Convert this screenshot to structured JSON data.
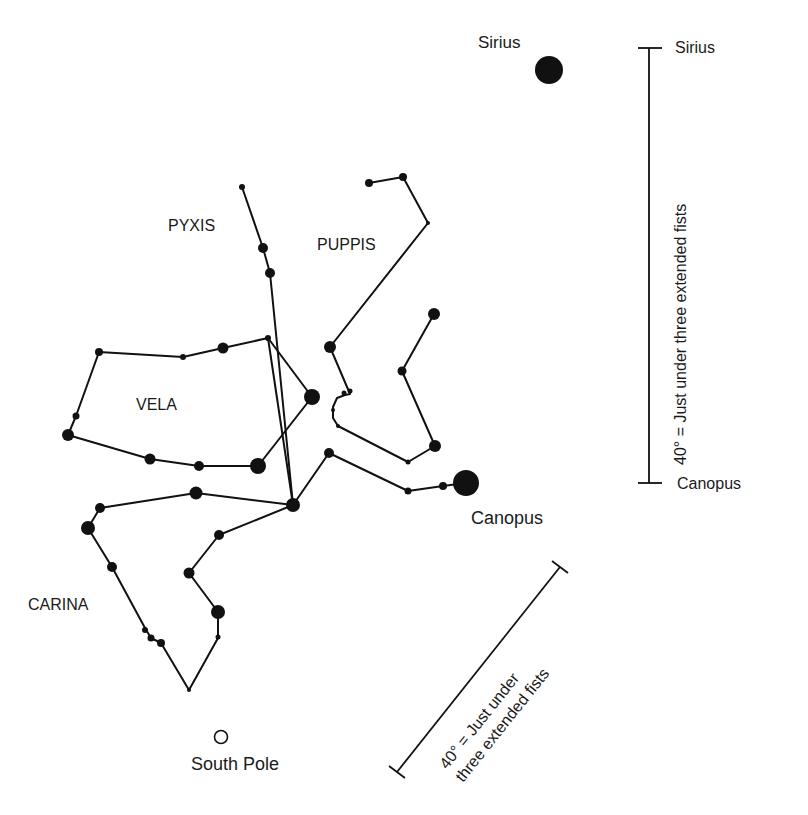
{
  "colors": {
    "ink": "#111111",
    "background": "#ffffff"
  },
  "labels": {
    "sirius_star": "Sirius",
    "canopus_star": "Canopus",
    "south_pole": "South Pole",
    "pyxis": "PYXIS",
    "puppis": "PUPPIS",
    "vela": "VELA",
    "carina": "CARINA"
  },
  "scale_vertical": {
    "top_label": "Sirius",
    "bottom_label": "Canopus",
    "text": "40° = Just under three extended fists"
  },
  "scale_diagonal": {
    "line1": "40° = Just under",
    "line2": "three extended fists"
  },
  "chart_data": {
    "type": "star-chart",
    "stars": {
      "sirius": {
        "x": 549,
        "y": 70,
        "r": 14
      },
      "canopus": {
        "x": 466,
        "y": 483,
        "r": 13
      },
      "hub": {
        "x": 293,
        "y": 505,
        "r": 7
      }
    },
    "lines": [
      {
        "name": "pyxis",
        "points": [
          [
            242,
            187
          ],
          [
            263,
            248
          ],
          [
            270,
            273
          ],
          [
            293,
            505
          ]
        ]
      },
      {
        "name": "puppis-north",
        "points": [
          [
            369,
            183
          ],
          [
            403,
            177
          ],
          [
            428,
            223
          ],
          [
            330,
            347
          ],
          [
            350,
            394
          ],
          [
            345,
            395
          ],
          [
            337,
            398
          ],
          [
            333,
            407
          ],
          [
            333,
            418
          ],
          [
            338,
            426
          ],
          [
            408,
            462
          ],
          [
            435,
            446
          ],
          [
            402,
            371
          ],
          [
            434,
            314
          ]
        ]
      },
      {
        "name": "vela",
        "points": [
          [
            99,
            352
          ],
          [
            183,
            357
          ],
          [
            223,
            348
          ],
          [
            268,
            338
          ],
          [
            312,
            397
          ],
          [
            258,
            466
          ],
          [
            199,
            466
          ],
          [
            150,
            459
          ],
          [
            68,
            435
          ],
          [
            76,
            416
          ],
          [
            99,
            352
          ]
        ]
      },
      {
        "name": "vela-cross",
        "points": [
          [
            268,
            338
          ],
          [
            293,
            505
          ]
        ]
      },
      {
        "name": "puppis-south",
        "points": [
          [
            293,
            505
          ],
          [
            329,
            453
          ],
          [
            408,
            491
          ],
          [
            443,
            486
          ],
          [
            466,
            483
          ]
        ]
      },
      {
        "name": "hub-west",
        "points": [
          [
            293,
            505
          ],
          [
            196,
            493
          ],
          [
            100,
            508
          ],
          [
            88,
            528
          ]
        ]
      },
      {
        "name": "carina-west",
        "points": [
          [
            88,
            528
          ],
          [
            112,
            567
          ],
          [
            145,
            628
          ],
          [
            151,
            638
          ],
          [
            161,
            643
          ],
          [
            189,
            690
          ]
        ]
      },
      {
        "name": "carina-east",
        "points": [
          [
            293,
            505
          ],
          [
            219,
            535
          ],
          [
            189,
            573
          ],
          [
            218,
            612
          ],
          [
            218,
            638
          ],
          [
            189,
            690
          ]
        ]
      }
    ],
    "star_points": [
      {
        "x": 242,
        "y": 187,
        "r": 3
      },
      {
        "x": 263,
        "y": 248,
        "r": 5
      },
      {
        "x": 270,
        "y": 273,
        "r": 5
      },
      {
        "x": 369,
        "y": 183,
        "r": 4
      },
      {
        "x": 403,
        "y": 177,
        "r": 4
      },
      {
        "x": 428,
        "y": 223,
        "r": 2
      },
      {
        "x": 330,
        "y": 347,
        "r": 6
      },
      {
        "x": 350,
        "y": 391,
        "r": 2.5
      },
      {
        "x": 344,
        "y": 393,
        "r": 2.5
      },
      {
        "x": 333,
        "y": 410,
        "r": 2
      },
      {
        "x": 338,
        "y": 426,
        "r": 2
      },
      {
        "x": 408,
        "y": 462,
        "r": 2.5
      },
      {
        "x": 435,
        "y": 446,
        "r": 6
      },
      {
        "x": 402,
        "y": 371,
        "r": 4.5
      },
      {
        "x": 434,
        "y": 314,
        "r": 6
      },
      {
        "x": 99,
        "y": 352,
        "r": 4
      },
      {
        "x": 183,
        "y": 357,
        "r": 3
      },
      {
        "x": 223,
        "y": 348,
        "r": 5.5
      },
      {
        "x": 268,
        "y": 338,
        "r": 3
      },
      {
        "x": 312,
        "y": 397,
        "r": 8
      },
      {
        "x": 258,
        "y": 466,
        "r": 8
      },
      {
        "x": 199,
        "y": 466,
        "r": 5
      },
      {
        "x": 150,
        "y": 459,
        "r": 5.5
      },
      {
        "x": 68,
        "y": 435,
        "r": 6
      },
      {
        "x": 76,
        "y": 416,
        "r": 3.5
      },
      {
        "x": 329,
        "y": 453,
        "r": 5
      },
      {
        "x": 408,
        "y": 491,
        "r": 3.5
      },
      {
        "x": 443,
        "y": 486,
        "r": 4
      },
      {
        "x": 196,
        "y": 493,
        "r": 6.5
      },
      {
        "x": 100,
        "y": 508,
        "r": 5
      },
      {
        "x": 88,
        "y": 528,
        "r": 7
      },
      {
        "x": 112,
        "y": 567,
        "r": 5
      },
      {
        "x": 145,
        "y": 630,
        "r": 3
      },
      {
        "x": 151,
        "y": 638,
        "r": 3.5
      },
      {
        "x": 161,
        "y": 643,
        "r": 4
      },
      {
        "x": 189,
        "y": 690,
        "r": 2
      },
      {
        "x": 219,
        "y": 535,
        "r": 5
      },
      {
        "x": 189,
        "y": 573,
        "r": 5.5
      },
      {
        "x": 218,
        "y": 612,
        "r": 7
      },
      {
        "x": 218,
        "y": 637,
        "r": 2.5
      }
    ],
    "scale_bars": [
      {
        "name": "vertical",
        "x1": 649,
        "y1": 48,
        "x2": 649,
        "y2": 483,
        "angle_deg": 40
      },
      {
        "name": "diagonal",
        "x1": 397,
        "y1": 772,
        "x2": 560,
        "y2": 567,
        "angle_deg": 40
      }
    ]
  }
}
